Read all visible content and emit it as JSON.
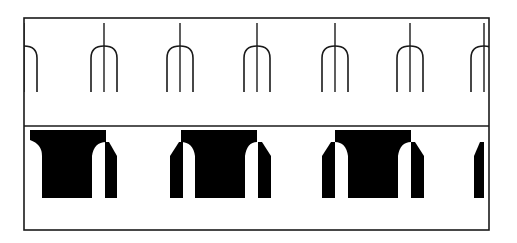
{
  "diagram": {
    "type": "pattern-strip-diagram",
    "frame": {
      "x": 24,
      "y": 18,
      "width": 465,
      "height": 212,
      "divider_y": 126,
      "stroke": "#1a1a1a"
    },
    "top_strip": {
      "label": "",
      "element": "fork (arched outline with central stem)",
      "centers_x": [
        24,
        104,
        180,
        257,
        335,
        410,
        484
      ],
      "stem_top_y": 23,
      "arch_top_y": 46,
      "arch_half_width": 13,
      "bottom_y": 92,
      "stroke": "#1a1a1a"
    },
    "bottom_strip": {
      "label": "",
      "element": "solid T-blocks with arched cutouts and side teeth",
      "blocks": [
        {
          "x": 30,
          "bar_right": 106,
          "trunk_left": 42,
          "trunk_right": 92,
          "arch_right": true,
          "arch_left": false
        },
        {
          "x": 181,
          "bar_right": 257,
          "trunk_left": 195,
          "trunk_right": 245,
          "arch_left": true,
          "arch_right": true
        },
        {
          "x": 335,
          "bar_right": 411,
          "trunk_left": 348,
          "trunk_right": 398,
          "arch_left": true,
          "arch_right": true
        }
      ],
      "teeth": [
        {
          "x": 105,
          "w": 12,
          "side": "right"
        },
        {
          "x": 170,
          "w": 13,
          "side": "left"
        },
        {
          "x": 258,
          "w": 13,
          "side": "right"
        },
        {
          "x": 322,
          "w": 13,
          "side": "left"
        },
        {
          "x": 411,
          "w": 13,
          "side": "right"
        },
        {
          "x": 474,
          "w": 10,
          "side": "left"
        }
      ],
      "top_y": 130,
      "bar_bottom_y": 150,
      "bottom_y": 198,
      "fill": "#000000"
    }
  }
}
